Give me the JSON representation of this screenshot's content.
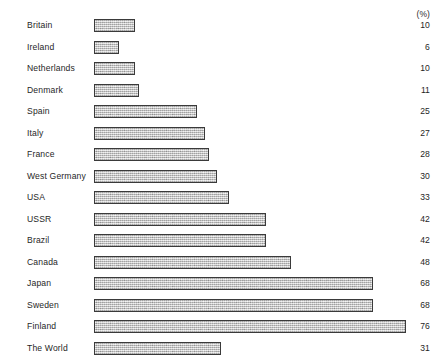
{
  "chart_data": {
    "type": "bar",
    "orientation": "horizontal",
    "title": "",
    "subtitle": "",
    "xlabel": "",
    "ylabel": "",
    "unit_header": "(%)",
    "grid": false,
    "legend": null,
    "xlim": [
      0,
      76
    ],
    "categories": [
      "Britain",
      "Ireland",
      "Netherlands",
      "Denmark",
      "Spain",
      "Italy",
      "France",
      "West Germany",
      "USA",
      "USSR",
      "Brazil",
      "Canada",
      "Japan",
      "Sweden",
      "Finland",
      "The World"
    ],
    "values": [
      10,
      6,
      10,
      11,
      25,
      27,
      28,
      30,
      33,
      42,
      42,
      48,
      68,
      68,
      76,
      31
    ],
    "value_labels": [
      "10",
      "6",
      "10",
      "11",
      "25",
      "27",
      "28",
      "30",
      "33",
      "42",
      "42",
      "48",
      "68",
      "68",
      "76",
      "31"
    ],
    "colors": {
      "bar_fill": "#c9c9c9",
      "bar_border": "#3a3a3a",
      "text": "#1f1f1f",
      "background": "#ffffff"
    }
  }
}
